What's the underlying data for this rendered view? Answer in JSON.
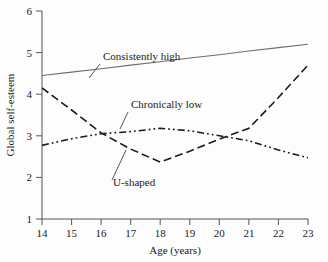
{
  "chart_data": {
    "type": "line",
    "title": "",
    "xlabel": "Age (years)",
    "ylabel": "Global self-esteem",
    "xlim": [
      14,
      23
    ],
    "ylim": [
      1,
      6
    ],
    "grid": false,
    "legend_position": "inline-annotations",
    "x": [
      14,
      15,
      16,
      17,
      18,
      19,
      20,
      21,
      22,
      23
    ],
    "xticks": [
      "14",
      "15",
      "16",
      "17",
      "18",
      "19",
      "20",
      "21",
      "22",
      "23"
    ],
    "yticks": [
      "1",
      "2",
      "3",
      "4",
      "5",
      "6"
    ],
    "series": [
      {
        "name": "Consistently high",
        "style": "solid",
        "color": "#6e6e6e",
        "values": [
          4.45,
          4.53,
          4.61,
          4.7,
          4.78,
          4.87,
          4.95,
          5.04,
          5.12,
          5.2
        ]
      },
      {
        "name": "U-shaped",
        "style": "dashed",
        "color": "#1a1a1a",
        "values": [
          4.15,
          3.62,
          3.07,
          2.68,
          2.37,
          2.63,
          2.92,
          3.18,
          3.92,
          4.7
        ]
      },
      {
        "name": "Chronically low",
        "style": "dash-dot-dot",
        "color": "#1a1a1a",
        "values": [
          2.77,
          2.93,
          3.05,
          3.1,
          3.18,
          3.12,
          3.0,
          2.88,
          2.66,
          2.47
        ]
      }
    ],
    "annotations": [
      {
        "text": "Consistently high",
        "series": "Consistently high",
        "x": 16.2,
        "y": 5.25
      },
      {
        "text": "Chronically low",
        "series": "Chronically low",
        "x": 17.1,
        "y": 3.72
      },
      {
        "text": "U-shaped",
        "series": "U-shaped",
        "x": 16.6,
        "y": 1.92
      }
    ]
  },
  "axes": {
    "x_title": "Age (years)",
    "y_title": "Global self-esteem",
    "x_tick_labels": [
      "14",
      "15",
      "16",
      "17",
      "18",
      "19",
      "20",
      "21",
      "22",
      "23"
    ],
    "y_tick_labels": [
      "1",
      "2",
      "3",
      "4",
      "5",
      "6"
    ]
  },
  "annotations": {
    "consistently_high": "Consistently high",
    "chronically_low": "Chronically low",
    "u_shaped": "U-shaped"
  },
  "colors": {
    "solid_line": "#6e6e6e",
    "dashed_line": "#1a1a1a",
    "dashdotdot_line": "#1a1a1a",
    "axis": "#555555",
    "text": "#1a1a1a",
    "background": "#fdfdfd"
  }
}
